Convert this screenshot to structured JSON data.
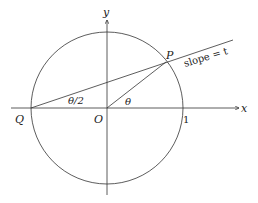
{
  "diagram": {
    "type": "unit-circle-tangent-half-angle",
    "colors": {
      "stroke": "#333333",
      "background": "#ffffff"
    },
    "axes": {
      "x_label": "x",
      "y_label": "y"
    },
    "points": {
      "origin": "O",
      "left_point": "Q",
      "circle_point": "P",
      "unit_tick": "1"
    },
    "angles": {
      "center_angle": "θ",
      "half_angle": "θ/2"
    },
    "line_label": "slope = t"
  }
}
